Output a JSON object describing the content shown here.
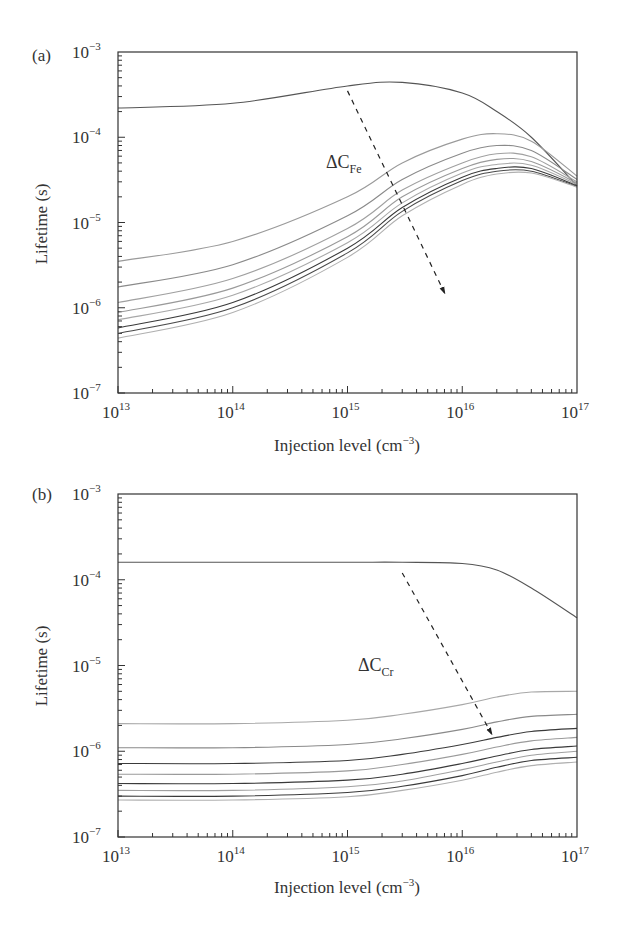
{
  "chart_data": [
    {
      "type": "line",
      "panel_label": "(a)",
      "title": "",
      "xlabel": "Injection level (cm⁻³)",
      "ylabel": "Lifetime (s)",
      "xscale": "log",
      "yscale": "log",
      "xlim": [
        10000000000000.0,
        1e+17
      ],
      "ylim": [
        1e-07,
        0.001
      ],
      "x_ticks": [
        "10^13",
        "10^14",
        "10^15",
        "10^16",
        "10^17"
      ],
      "y_ticks": [
        "10^-7",
        "10^-6",
        "10^-5",
        "10^-4",
        "10^-3"
      ],
      "grid": false,
      "legend": null,
      "annotation": {
        "text": "ΔC",
        "subscript": "Fe",
        "arrow": "dashed, pointing toward decreasing lifetime (increasing Fe concentration)"
      },
      "x": [
        10000000000000.0,
        100000000000000.0,
        1000000000000000.0,
        3000000000000000.0,
        1e+16,
        2e+16,
        4e+16,
        1e+17
      ],
      "series": [
        {
          "name": "curve 1",
          "color": "#555555",
          "values": [
            0.00022,
            0.00025,
            0.0004,
            0.00044,
            0.00033,
            0.0002,
            0.0001,
            2.7e-05
          ]
        },
        {
          "name": "curve 2",
          "color": "#9a9a9a",
          "values": [
            3.5e-06,
            6e-06,
            2e-05,
            5e-05,
            9.5e-05,
            0.00011,
            9e-05,
            3.5e-05
          ]
        },
        {
          "name": "curve 3",
          "color": "#8a8a8a",
          "values": [
            1.75e-06,
            3.2e-06,
            1.2e-05,
            3.2e-05,
            6.5e-05,
            8e-05,
            7e-05,
            3.2e-05
          ]
        },
        {
          "name": "curve 4",
          "color": "#a0a0a0",
          "values": [
            1.15e-06,
            2.2e-06,
            8.5e-06,
            2.4e-05,
            5e-05,
            6.4e-05,
            5.9e-05,
            3e-05
          ]
        },
        {
          "name": "curve 5",
          "color": "#9a9a9a",
          "values": [
            8.8e-07,
            1.7e-06,
            6.8e-06,
            2e-05,
            4.3e-05,
            5.5e-05,
            5.2e-05,
            2.9e-05
          ]
        },
        {
          "name": "curve 6",
          "color": "#a8a8a8",
          "values": [
            7.2e-07,
            1.4e-06,
            5.8e-06,
            1.7e-05,
            3.8e-05,
            4.8e-05,
            4.7e-05,
            2.8e-05
          ]
        },
        {
          "name": "curve 7",
          "color": "#3a3a3a",
          "values": [
            5.8e-07,
            1.15e-06,
            5e-06,
            1.5e-05,
            3.4e-05,
            4.3e-05,
            4.3e-05,
            2.7e-05
          ]
        },
        {
          "name": "curve 8",
          "color": "#4a4a4a",
          "values": [
            5e-07,
            1e-06,
            4.4e-06,
            1.35e-05,
            3.1e-05,
            4e-05,
            4e-05,
            2.65e-05
          ]
        },
        {
          "name": "curve 9",
          "color": "#b0b0b0",
          "values": [
            4.4e-07,
            8.8e-07,
            3.9e-06,
            1.2e-05,
            2.8e-05,
            3.7e-05,
            3.8e-05,
            2.6e-05
          ]
        }
      ],
      "arrow_points": {
        "from": [
          1000000000000000.0,
          0.00035
        ],
        "to": [
          7000000000000000.0,
          1.5e-06
        ]
      }
    },
    {
      "type": "line",
      "panel_label": "(b)",
      "title": "",
      "xlabel": "Injection level (cm⁻³)",
      "ylabel": "Lifetime (s)",
      "xscale": "log",
      "yscale": "log",
      "xlim": [
        10000000000000.0,
        1e+17
      ],
      "ylim": [
        1e-07,
        0.001
      ],
      "x_ticks": [
        "10^13",
        "10^14",
        "10^15",
        "10^16",
        "10^17"
      ],
      "y_ticks": [
        "10^-7",
        "10^-6",
        "10^-5",
        "10^-4",
        "10^-3"
      ],
      "grid": false,
      "legend": null,
      "annotation": {
        "text": "ΔC",
        "subscript": "Cr",
        "arrow": "dashed, pointing toward decreasing lifetime (increasing Cr concentration)"
      },
      "x": [
        10000000000000.0,
        100000000000000.0,
        1000000000000000.0,
        3000000000000000.0,
        1e+16,
        2e+16,
        4e+16,
        1e+17
      ],
      "series": [
        {
          "name": "curve 1",
          "color": "#555555",
          "values": [
            0.00016,
            0.00016,
            0.00016,
            0.00016,
            0.000155,
            0.00013,
            8e-05,
            3.6e-05
          ]
        },
        {
          "name": "curve 2",
          "color": "#a8a8a8",
          "values": [
            2.1e-06,
            2.1e-06,
            2.3e-06,
            2.7e-06,
            3.5e-06,
            4.3e-06,
            4.9e-06,
            5e-06
          ]
        },
        {
          "name": "curve 3",
          "color": "#8a8a8a",
          "values": [
            1.1e-06,
            1.1e-06,
            1.2e-06,
            1.4e-06,
            1.8e-06,
            2.2e-06,
            2.55e-06,
            2.7e-06
          ]
        },
        {
          "name": "curve 4",
          "color": "#3a3a3a",
          "values": [
            7.2e-07,
            7.2e-07,
            7.8e-07,
            9.2e-07,
            1.2e-06,
            1.45e-06,
            1.7e-06,
            1.85e-06
          ]
        },
        {
          "name": "curve 5",
          "color": "#9a9a9a",
          "values": [
            5.4e-07,
            5.4e-07,
            5.9e-07,
            7e-07,
            9.2e-07,
            1.12e-06,
            1.32e-06,
            1.45e-06
          ]
        },
        {
          "name": "curve 6",
          "color": "#3a3a3a",
          "values": [
            4.2e-07,
            4.2e-07,
            4.6e-07,
            5.4e-07,
            7.2e-07,
            8.8e-07,
            1.05e-06,
            1.15e-06
          ]
        },
        {
          "name": "curve 7",
          "color": "#a0a0a0",
          "values": [
            3.5e-07,
            3.5e-07,
            3.85e-07,
            4.5e-07,
            6.1e-07,
            7.5e-07,
            9e-07,
            1e-06
          ]
        },
        {
          "name": "curve 8",
          "color": "#3a3a3a",
          "values": [
            3e-07,
            3e-07,
            3.3e-07,
            3.9e-07,
            5.2e-07,
            6.5e-07,
            7.8e-07,
            8.5e-07
          ]
        },
        {
          "name": "curve 9",
          "color": "#b0b0b0",
          "values": [
            2.7e-07,
            2.7e-07,
            2.95e-07,
            3.5e-07,
            4.6e-07,
            5.7e-07,
            6.8e-07,
            7.5e-07
          ]
        }
      ],
      "arrow_points": {
        "from": [
          3000000000000000.0,
          0.00012
        ],
        "to": [
          1.8e+16,
          1.6e-06
        ]
      }
    }
  ],
  "panels": [
    {
      "label": "(a)",
      "ylabel": "Lifetime (s)",
      "xlabel": "Injection level (cm",
      "xlabel_exp": "−3",
      "annotation_main": "ΔC",
      "annotation_sub": "Fe"
    },
    {
      "label": "(b)",
      "ylabel": "Lifetime (s)",
      "xlabel": "Injection level (cm",
      "xlabel_exp": "−3",
      "annotation_main": "ΔC",
      "annotation_sub": "Cr"
    }
  ],
  "axis_ticks": {
    "x": [
      {
        "base": "10",
        "exp": "13"
      },
      {
        "base": "10",
        "exp": "14"
      },
      {
        "base": "10",
        "exp": "15"
      },
      {
        "base": "10",
        "exp": "16"
      },
      {
        "base": "10",
        "exp": "17"
      }
    ],
    "y": [
      {
        "base": "10",
        "exp": "−7"
      },
      {
        "base": "10",
        "exp": "−6"
      },
      {
        "base": "10",
        "exp": "−5"
      },
      {
        "base": "10",
        "exp": "−4"
      },
      {
        "base": "10",
        "exp": "−3"
      }
    ]
  }
}
